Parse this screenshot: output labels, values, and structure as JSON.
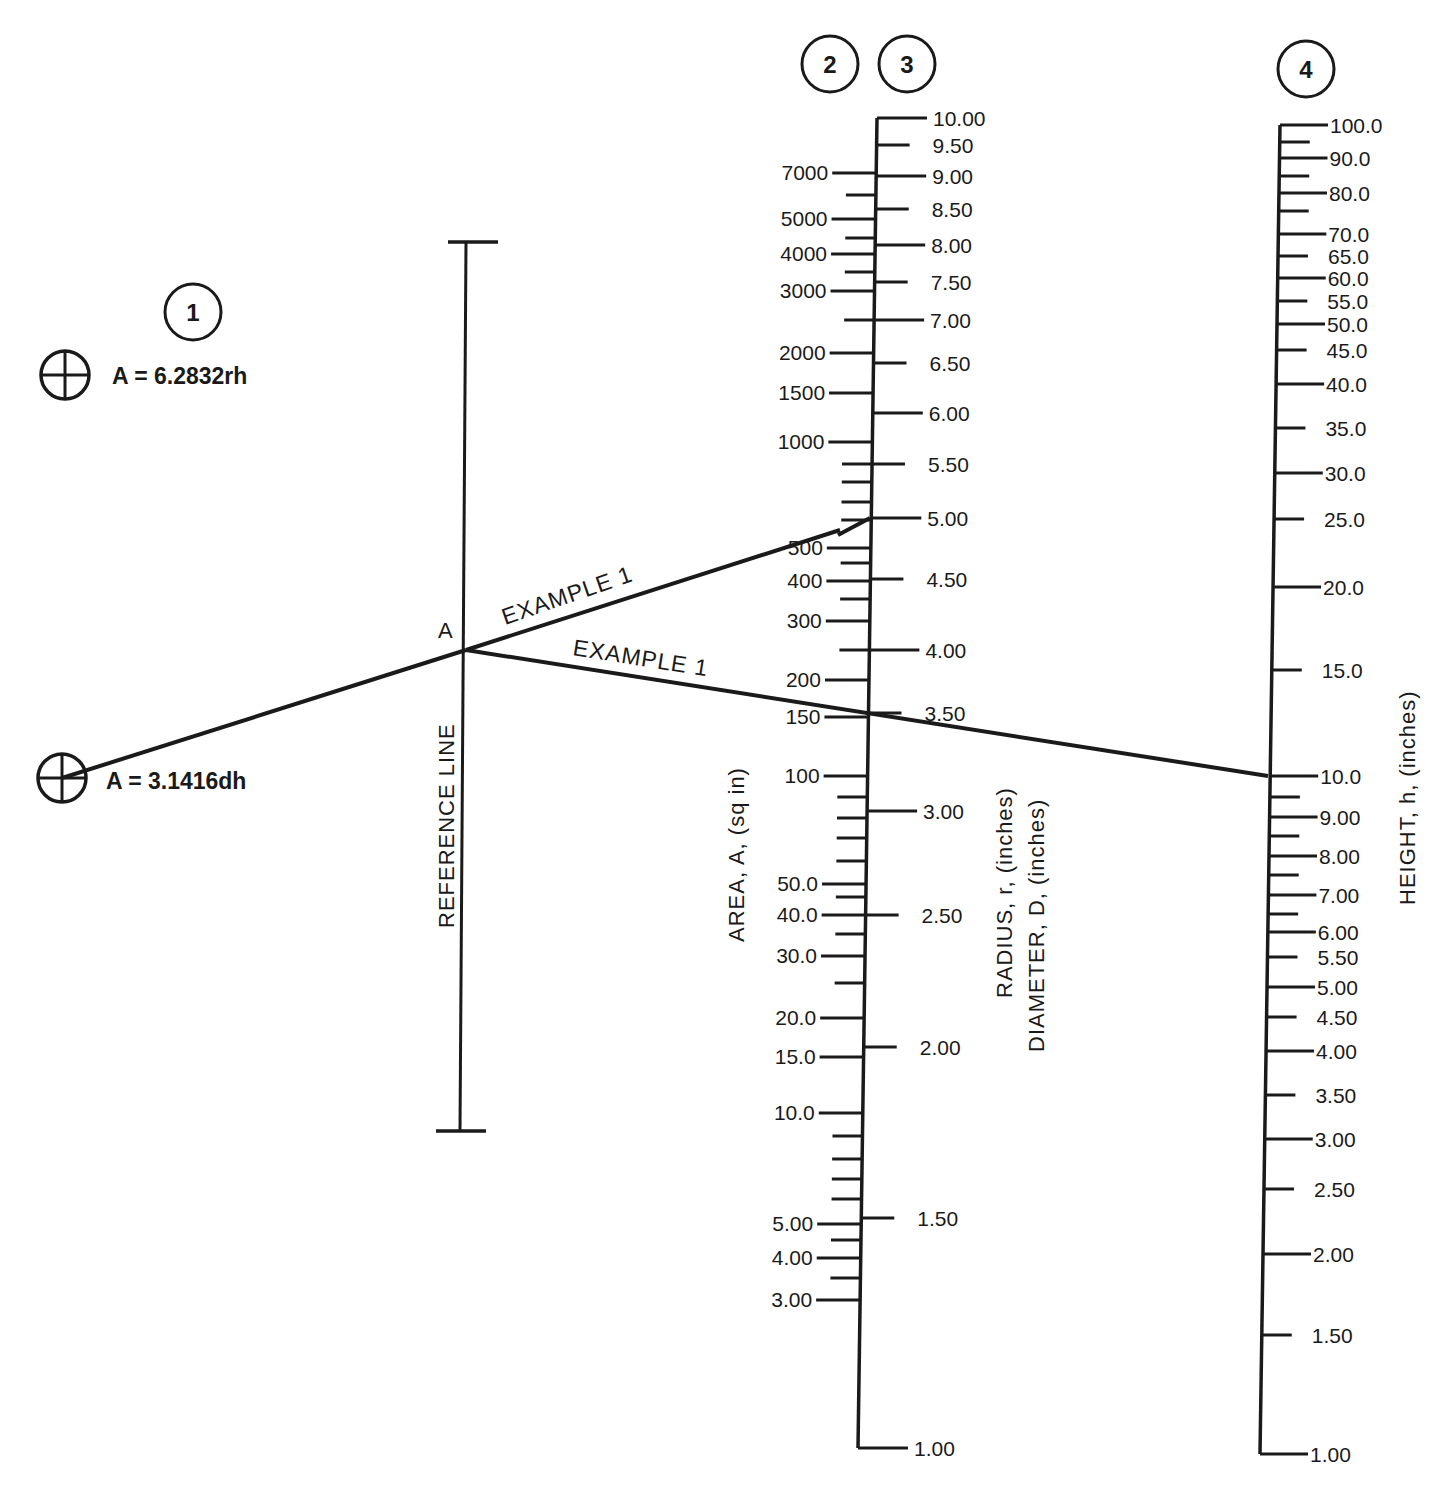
{
  "chart_data": {
    "type": "nomograph",
    "formulas": [
      {
        "id": "radius",
        "text": "A = 6.2832rh"
      },
      {
        "id": "diameter",
        "text": "A = 3.1416dh"
      }
    ],
    "step_badges": [
      "1",
      "2",
      "3",
      "4"
    ],
    "reference_line": {
      "label": "REFERENCE LINE",
      "point_label": "A"
    },
    "example_labels": [
      "EXAMPLE 1",
      "EXAMPLE 1"
    ],
    "scales": [
      {
        "id": "area",
        "step": "2",
        "title": "AREA, A, (sq in)",
        "side": "left",
        "major": [
          {
            "label": "7000",
            "y": 173
          },
          {
            "label": "5000",
            "y": 219
          },
          {
            "label": "4000",
            "y": 254
          },
          {
            "label": "3000",
            "y": 291
          },
          {
            "label": "2000",
            "y": 353
          },
          {
            "label": "1500",
            "y": 393
          },
          {
            "label": "1000",
            "y": 442
          },
          {
            "label": "500",
            "y": 548
          },
          {
            "label": "400",
            "y": 581
          },
          {
            "label": "300",
            "y": 621
          },
          {
            "label": "200",
            "y": 680
          },
          {
            "label": "150",
            "y": 717
          },
          {
            "label": "100",
            "y": 776
          },
          {
            "label": "50.0",
            "y": 884
          },
          {
            "label": "40.0",
            "y": 915
          },
          {
            "label": "30.0",
            "y": 956
          },
          {
            "label": "20.0",
            "y": 1018
          },
          {
            "label": "15.0",
            "y": 1057
          },
          {
            "label": "10.0",
            "y": 1113
          },
          {
            "label": "5.00",
            "y": 1224
          },
          {
            "label": "4.00",
            "y": 1258
          },
          {
            "label": "3.00",
            "y": 1300
          }
        ],
        "minor_y": [
          195,
          238,
          272,
          320,
          464,
          482,
          502,
          520,
          563,
          599,
          650,
          797,
          818,
          838,
          861,
          897,
          934,
          983,
          1136,
          1159,
          1179,
          1199,
          1240,
          1278
        ]
      },
      {
        "id": "radius_diameter",
        "step": "3",
        "title_radius": "RADIUS, r, (inches)",
        "title_diameter": "DIAMETER, D, (inches)",
        "side": "right",
        "major": [
          {
            "label": "10.00",
            "y": 118,
            "long": true
          },
          {
            "label": "9.50",
            "y": 145,
            "long": false
          },
          {
            "label": "9.00",
            "y": 176,
            "long": true
          },
          {
            "label": "8.50",
            "y": 209,
            "long": false
          },
          {
            "label": "8.00",
            "y": 245,
            "long": true
          },
          {
            "label": "7.50",
            "y": 282,
            "long": false
          },
          {
            "label": "7.00",
            "y": 320,
            "long": true
          },
          {
            "label": "6.50",
            "y": 363,
            "long": false
          },
          {
            "label": "6.00",
            "y": 413,
            "long": true
          },
          {
            "label": "5.50",
            "y": 464,
            "long": false
          },
          {
            "label": "5.00",
            "y": 518,
            "long": true
          },
          {
            "label": "4.50",
            "y": 579,
            "long": false
          },
          {
            "label": "4.00",
            "y": 650,
            "long": true
          },
          {
            "label": "3.50",
            "y": 713,
            "long": false
          },
          {
            "label": "3.00",
            "y": 811,
            "long": true
          },
          {
            "label": "2.50",
            "y": 915,
            "long": false
          },
          {
            "label": "2.00",
            "y": 1047,
            "long": false
          },
          {
            "label": "1.50",
            "y": 1218,
            "long": false
          },
          {
            "label": "1.00",
            "y": 1448,
            "long": true
          }
        ]
      },
      {
        "id": "height",
        "step": "4",
        "title": "HEIGHT, h, (inches)",
        "side": "right",
        "major": [
          {
            "label": "100.0",
            "y": 125,
            "long": true
          },
          {
            "label": "90.0",
            "y": 158,
            "long": true
          },
          {
            "label": "80.0",
            "y": 193,
            "long": true
          },
          {
            "label": "70.0",
            "y": 234,
            "long": true
          },
          {
            "label": "65.0",
            "y": 256,
            "long": false
          },
          {
            "label": "60.0",
            "y": 278,
            "long": true
          },
          {
            "label": "55.0",
            "y": 301,
            "long": false
          },
          {
            "label": "50.0",
            "y": 324,
            "long": true
          },
          {
            "label": "45.0",
            "y": 350,
            "long": false
          },
          {
            "label": "40.0",
            "y": 384,
            "long": true
          },
          {
            "label": "35.0",
            "y": 428,
            "long": false
          },
          {
            "label": "30.0",
            "y": 473,
            "long": true
          },
          {
            "label": "25.0",
            "y": 519,
            "long": false
          },
          {
            "label": "20.0",
            "y": 587,
            "long": true
          },
          {
            "label": "15.0",
            "y": 670,
            "long": false
          },
          {
            "label": "10.0",
            "y": 776,
            "long": true
          },
          {
            "label": "9.00",
            "y": 817,
            "long": true
          },
          {
            "label": "8.00",
            "y": 856,
            "long": true
          },
          {
            "label": "7.00",
            "y": 895,
            "long": true
          },
          {
            "label": "6.00",
            "y": 932,
            "long": true
          },
          {
            "label": "5.50",
            "y": 957,
            "long": false
          },
          {
            "label": "5.00",
            "y": 987,
            "long": true
          },
          {
            "label": "4.50",
            "y": 1017,
            "long": false
          },
          {
            "label": "4.00",
            "y": 1051,
            "long": true
          },
          {
            "label": "3.50",
            "y": 1095,
            "long": false
          },
          {
            "label": "3.00",
            "y": 1139,
            "long": true
          },
          {
            "label": "2.50",
            "y": 1189,
            "long": false
          },
          {
            "label": "2.00",
            "y": 1254,
            "long": true
          },
          {
            "label": "1.50",
            "y": 1335,
            "long": false
          },
          {
            "label": "1.00",
            "y": 1454,
            "long": true
          }
        ],
        "minor_y": [
          142,
          176,
          211,
          797,
          836,
          875,
          914
        ]
      }
    ],
    "example_1": {
      "diameter_point": "diameter symbol",
      "radius": 5.0,
      "area": 157,
      "reference_point": "A",
      "radius_at_crossing": 3.5,
      "height": 10.0
    },
    "colors": {
      "ink": "#1a1a1a",
      "background": "#ffffff"
    }
  }
}
